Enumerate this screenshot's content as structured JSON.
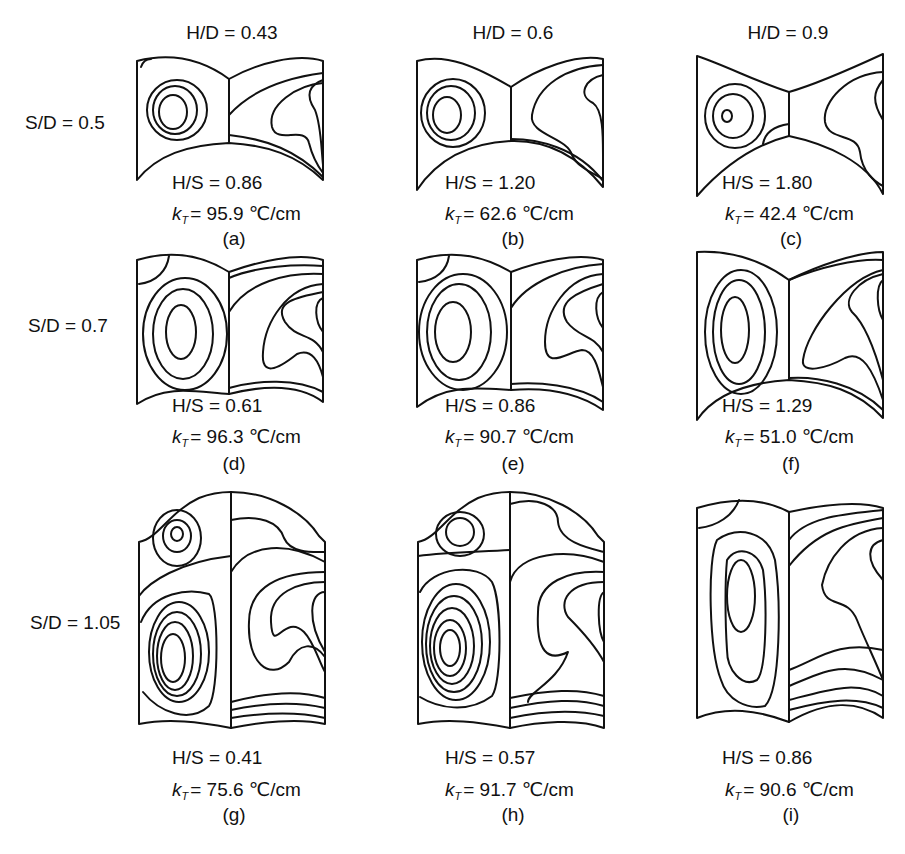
{
  "figure": {
    "column_headers": [
      "H/D = 0.43",
      "H/D = 0.6",
      "H/D = 0.9"
    ],
    "row_headers": [
      "S/D = 0.5",
      "S/D = 0.7",
      "S/D = 1.05"
    ],
    "kt_symbol": "k",
    "kt_subscript": "T",
    "panels": [
      {
        "id": "a",
        "label": "(a)",
        "hs": "H/S = 0.86",
        "kt_value": "= 95.9 ℃/cm"
      },
      {
        "id": "b",
        "label": "(b)",
        "hs": "H/S = 1.20",
        "kt_value": "= 62.6 ℃/cm"
      },
      {
        "id": "c",
        "label": "(c)",
        "hs": "H/S = 1.80",
        "kt_value": "= 42.4 ℃/cm"
      },
      {
        "id": "d",
        "label": "(d)",
        "hs": "H/S = 0.61",
        "kt_value": "= 96.3 ℃/cm"
      },
      {
        "id": "e",
        "label": "(e)",
        "hs": "H/S = 0.86",
        "kt_value": "= 90.7 ℃/cm"
      },
      {
        "id": "f",
        "label": "(f)",
        "hs": "H/S = 1.29",
        "kt_value": "= 51.0 ℃/cm"
      },
      {
        "id": "g",
        "label": "(g)",
        "hs": "H/S = 0.41",
        "kt_value": "= 75.6 ℃/cm"
      },
      {
        "id": "h",
        "label": "(h)",
        "hs": "H/S = 0.57",
        "kt_value": "= 91.7 ℃/cm"
      },
      {
        "id": "i",
        "label": "(i)",
        "hs": "H/S = 0.86",
        "kt_value": "= 90.6 ℃/cm"
      }
    ]
  }
}
